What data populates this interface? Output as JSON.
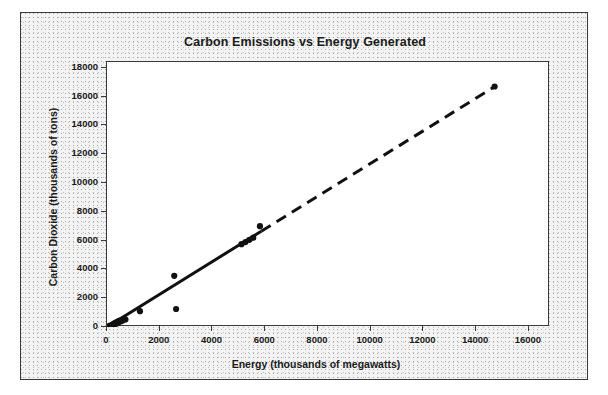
{
  "figure": {
    "background_color": "#ffffff",
    "frame_fill_color": "#f3f3f3",
    "frame_border_color": "#3a3a3a",
    "plot_background_color": "#ffffff",
    "marker_color": "#111111",
    "trend_line_color": "#111111"
  },
  "chart_data": {
    "type": "scatter",
    "title": "Carbon Emissions vs Energy Generated",
    "xlabel": "Energy (thousands of megawatts)",
    "ylabel": "Carbon Dioxide (thousands of tons)",
    "xlim": [
      0,
      16800
    ],
    "ylim": [
      0,
      18400
    ],
    "xticks": [
      0,
      2000,
      4000,
      6000,
      8000,
      10000,
      12000,
      14000,
      16000
    ],
    "yticks": [
      0,
      2000,
      4000,
      6000,
      8000,
      10000,
      12000,
      14000,
      16000,
      18000
    ],
    "xtick_labels": [
      "0",
      "2000",
      "4000",
      "6000",
      "8000",
      "10000",
      "12000",
      "14000",
      "16000"
    ],
    "ytick_labels": [
      "0",
      "2000",
      "4000",
      "6000",
      "8000",
      "10000",
      "12000",
      "14000",
      "16000",
      "18000"
    ],
    "grid": false,
    "legend": false,
    "legend_position": "none",
    "series": [
      {
        "name": "Carbon Dioxide vs Energy",
        "marker": "filled-circle",
        "points": [
          [
            60,
            40
          ],
          [
            110,
            90
          ],
          [
            150,
            60
          ],
          [
            190,
            150
          ],
          [
            230,
            120
          ],
          [
            260,
            230
          ],
          [
            300,
            180
          ],
          [
            330,
            300
          ],
          [
            360,
            250
          ],
          [
            390,
            350
          ],
          [
            420,
            300
          ],
          [
            450,
            420
          ],
          [
            480,
            380
          ],
          [
            510,
            450
          ],
          [
            540,
            400
          ],
          [
            570,
            500
          ],
          [
            600,
            470
          ],
          [
            650,
            560
          ],
          [
            700,
            520
          ],
          [
            1250,
            1100
          ],
          [
            2550,
            3550
          ],
          [
            2620,
            1250
          ],
          [
            5100,
            5750
          ],
          [
            5250,
            5900
          ],
          [
            5400,
            6050
          ],
          [
            5550,
            6200
          ],
          [
            5800,
            7000
          ],
          [
            14700,
            16700
          ]
        ]
      }
    ],
    "trend_line": {
      "style": "solid-then-dashed",
      "solid_from": [
        0,
        0
      ],
      "solid_to": [
        5850,
        6650
      ],
      "dashed_from": [
        5850,
        6650
      ],
      "dashed_to": [
        14750,
        16750
      ],
      "width_px": 3
    }
  }
}
